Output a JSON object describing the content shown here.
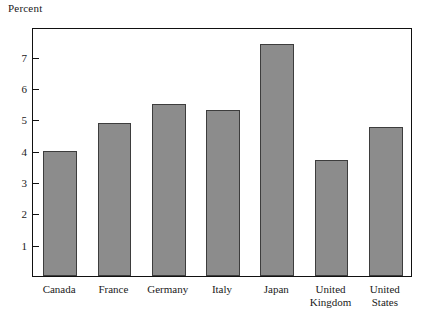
{
  "chart_data": {
    "type": "bar",
    "title": "",
    "ylabel": "Percent",
    "xlabel": "",
    "categories": [
      "Canada",
      "France",
      "Germany",
      "Italy",
      "Japan",
      "United Kingdom",
      "United States"
    ],
    "category_display": [
      "Canada",
      "France",
      "Germany",
      "Italy",
      "Japan",
      "United\nKingdom",
      "United\nStates"
    ],
    "values": [
      4.0,
      4.9,
      5.5,
      5.3,
      7.4,
      3.7,
      4.75
    ],
    "ylim": [
      0,
      7.95
    ],
    "yticks": [
      1,
      2,
      3,
      4,
      5,
      6,
      7
    ],
    "ytick_labels": [
      "1",
      "2",
      "3",
      "4",
      "5",
      "6",
      "7"
    ],
    "grid": false,
    "legend": false,
    "bar_fill_color": "#8c8c8c",
    "bar_edge_color": "#3d3d3d",
    "frame_color": "#111111",
    "background_color": "#ffffff"
  }
}
